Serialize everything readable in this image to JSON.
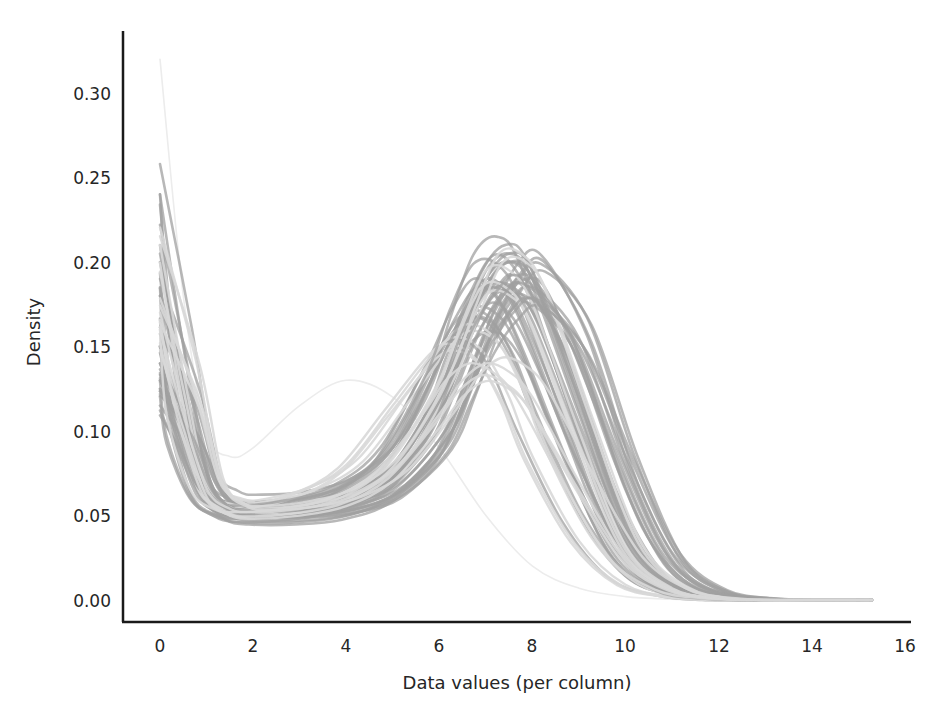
{
  "chart_data": {
    "type": "line",
    "title": "",
    "xlabel": "Data values (per column)",
    "ylabel": "Density",
    "xlim": [
      -0.8,
      16.1
    ],
    "ylim": [
      -0.013,
      0.335
    ],
    "x_ticks": [
      0,
      2,
      4,
      6,
      8,
      10,
      12,
      14,
      16
    ],
    "x_tick_labels": [
      "0",
      "2",
      "4",
      "6",
      "8",
      "10",
      "12",
      "14",
      "16"
    ],
    "y_ticks": [
      0.0,
      0.05,
      0.1,
      0.15,
      0.2,
      0.25,
      0.3
    ],
    "y_tick_labels": [
      "0.00",
      "0.05",
      "0.10",
      "0.15",
      "0.20",
      "0.25",
      "0.30"
    ],
    "grid": false,
    "legend": null,
    "curve_color": "#a0a0a0",
    "curve_color_light": "#d8d8d8",
    "series_summary": {
      "count_approx": 60,
      "density_at_zero_range": [
        0.11,
        0.24
      ],
      "trough_x_range": [
        1.5,
        3.0
      ],
      "trough_density_range": [
        0.045,
        0.07
      ],
      "peak_x_range": [
        5.8,
        8.2
      ],
      "peak_density_range": [
        0.12,
        0.2
      ],
      "tail_end_x": 15.3
    },
    "series": [
      {
        "name": "column-light-outlier-1",
        "style": "faint",
        "x": [
          0,
          0.5,
          1,
          1.5,
          2,
          3,
          4,
          5,
          6,
          7,
          8,
          9,
          10,
          11,
          12
        ],
        "y": [
          0.32,
          0.18,
          0.1,
          0.085,
          0.09,
          0.115,
          0.13,
          0.12,
          0.09,
          0.05,
          0.02,
          0.007,
          0.002,
          0.0005,
          0.0
        ]
      },
      {
        "name": "column-a",
        "style": "normal",
        "x": [
          0,
          0.5,
          1,
          1.5,
          2,
          3,
          4,
          5,
          6,
          6.5,
          7,
          7.5,
          8,
          9,
          10,
          11,
          12,
          13,
          14,
          15.3
        ],
        "y": [
          0.24,
          0.15,
          0.075,
          0.06,
          0.058,
          0.06,
          0.068,
          0.09,
          0.14,
          0.17,
          0.19,
          0.18,
          0.15,
          0.08,
          0.025,
          0.006,
          0.001,
          0.0,
          0.0,
          0.0
        ]
      },
      {
        "name": "column-b",
        "style": "normal",
        "x": [
          0,
          0.5,
          1,
          1.5,
          2,
          3,
          4,
          5,
          6,
          6.5,
          7,
          7.5,
          8,
          9,
          10,
          11,
          12,
          13,
          14,
          15.3
        ],
        "y": [
          0.2,
          0.13,
          0.07,
          0.055,
          0.052,
          0.053,
          0.058,
          0.072,
          0.11,
          0.15,
          0.185,
          0.2,
          0.19,
          0.12,
          0.045,
          0.01,
          0.002,
          0.0,
          0.0,
          0.0
        ]
      },
      {
        "name": "column-c",
        "style": "normal",
        "x": [
          0,
          0.5,
          1,
          1.5,
          2,
          3,
          4,
          5,
          6,
          6.5,
          7,
          7.5,
          8,
          9,
          10,
          11,
          12,
          13,
          14,
          15.3
        ],
        "y": [
          0.15,
          0.11,
          0.065,
          0.052,
          0.05,
          0.05,
          0.054,
          0.065,
          0.095,
          0.125,
          0.16,
          0.185,
          0.19,
          0.145,
          0.065,
          0.016,
          0.003,
          0.0,
          0.0,
          0.0
        ]
      },
      {
        "name": "column-d",
        "style": "normal",
        "x": [
          0,
          0.5,
          1,
          1.5,
          2,
          3,
          4,
          5,
          6,
          6.5,
          7,
          7.5,
          8,
          9,
          10,
          11,
          12,
          13,
          14,
          15.3
        ],
        "y": [
          0.13,
          0.1,
          0.065,
          0.055,
          0.054,
          0.058,
          0.067,
          0.09,
          0.145,
          0.165,
          0.165,
          0.145,
          0.11,
          0.05,
          0.014,
          0.003,
          0.0,
          0.0,
          0.0,
          0.0
        ]
      },
      {
        "name": "column-e",
        "style": "normal",
        "x": [
          0,
          0.5,
          1,
          1.5,
          2,
          3,
          4,
          5,
          6,
          6.5,
          7,
          7.5,
          8,
          9,
          10,
          11,
          12,
          13,
          14,
          15.3
        ],
        "y": [
          0.115,
          0.095,
          0.065,
          0.05,
          0.047,
          0.047,
          0.05,
          0.06,
          0.085,
          0.115,
          0.15,
          0.175,
          0.185,
          0.155,
          0.08,
          0.022,
          0.004,
          0.0,
          0.0,
          0.0
        ]
      },
      {
        "name": "column-f",
        "style": "normal",
        "x": [
          0,
          0.5,
          1,
          1.5,
          2,
          3,
          4,
          5,
          6,
          6.5,
          7,
          7.5,
          8,
          9,
          10,
          11,
          12,
          13,
          14,
          15.3
        ],
        "y": [
          0.18,
          0.12,
          0.068,
          0.054,
          0.05,
          0.051,
          0.056,
          0.07,
          0.115,
          0.155,
          0.19,
          0.2,
          0.185,
          0.11,
          0.038,
          0.008,
          0.001,
          0.0,
          0.0,
          0.0
        ]
      },
      {
        "name": "column-g",
        "style": "light",
        "x": [
          0,
          0.5,
          1,
          1.5,
          2,
          3,
          4,
          5,
          6,
          6.5,
          7,
          7.5,
          8,
          9,
          10,
          11,
          12,
          13,
          14,
          15.3
        ],
        "y": [
          0.17,
          0.115,
          0.067,
          0.057,
          0.057,
          0.064,
          0.08,
          0.115,
          0.15,
          0.155,
          0.145,
          0.12,
          0.085,
          0.035,
          0.009,
          0.002,
          0.0,
          0.0,
          0.0,
          0.0
        ]
      },
      {
        "name": "column-h",
        "style": "normal",
        "x": [
          0,
          0.5,
          1,
          1.5,
          2,
          3,
          4,
          5,
          6,
          6.5,
          7,
          7.5,
          8,
          9,
          10,
          11,
          12,
          13,
          14,
          15.3
        ],
        "y": [
          0.14,
          0.105,
          0.066,
          0.054,
          0.052,
          0.055,
          0.062,
          0.08,
          0.125,
          0.16,
          0.185,
          0.185,
          0.165,
          0.095,
          0.03,
          0.006,
          0.001,
          0.0,
          0.0,
          0.0
        ]
      },
      {
        "name": "column-i",
        "style": "light",
        "x": [
          0,
          0.5,
          1,
          1.5,
          2,
          3,
          4,
          5,
          6,
          6.5,
          7,
          7.5,
          8,
          9,
          10,
          11,
          12,
          13,
          14,
          15.3
        ],
        "y": [
          0.21,
          0.135,
          0.07,
          0.055,
          0.053,
          0.056,
          0.064,
          0.085,
          0.13,
          0.165,
          0.195,
          0.195,
          0.175,
          0.1,
          0.032,
          0.007,
          0.001,
          0.0,
          0.0,
          0.0
        ]
      },
      {
        "name": "column-j",
        "style": "normal",
        "x": [
          0,
          0.5,
          1,
          1.5,
          2,
          3,
          4,
          5,
          6,
          6.5,
          7,
          7.5,
          8,
          9,
          10,
          11,
          12,
          13,
          14,
          15.3
        ],
        "y": [
          0.125,
          0.1,
          0.066,
          0.053,
          0.05,
          0.05,
          0.053,
          0.062,
          0.09,
          0.12,
          0.15,
          0.17,
          0.178,
          0.15,
          0.085,
          0.028,
          0.006,
          0.001,
          0.0,
          0.0
        ]
      },
      {
        "name": "column-k",
        "style": "light",
        "x": [
          0,
          0.5,
          1,
          1.5,
          2,
          3,
          4,
          5,
          6,
          6.5,
          7,
          7.5,
          8,
          9,
          10,
          11,
          12,
          13,
          14,
          15.3
        ],
        "y": [
          0.16,
          0.11,
          0.066,
          0.054,
          0.052,
          0.054,
          0.06,
          0.076,
          0.11,
          0.13,
          0.14,
          0.135,
          0.12,
          0.07,
          0.025,
          0.006,
          0.001,
          0.0,
          0.0,
          0.0
        ]
      }
    ]
  },
  "axes": {
    "xlabel": "Data values (per column)",
    "ylabel": "Density",
    "x_tick_labels": [
      "0",
      "2",
      "4",
      "6",
      "8",
      "10",
      "12",
      "14",
      "16"
    ],
    "y_tick_labels": [
      "0.00",
      "0.05",
      "0.10",
      "0.15",
      "0.20",
      "0.25",
      "0.30"
    ]
  }
}
